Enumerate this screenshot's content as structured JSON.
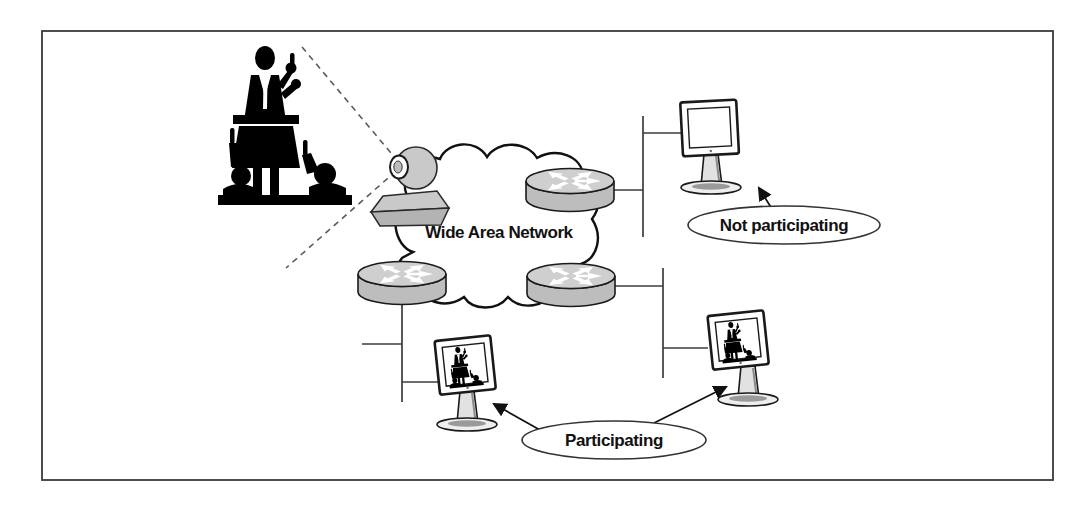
{
  "figure": {
    "type": "network-diagram",
    "wan_label": "Wide Area Network",
    "callouts": {
      "not_participating": "Not participating",
      "participating": "Participating"
    },
    "nodes": {
      "presenter": "speaker-at-podium-with-audience-silhouette",
      "camera": "video-camera-icon",
      "cloud": "wan-cloud",
      "routers": [
        "router-top-right",
        "router-bottom-left",
        "router-bottom-right"
      ],
      "workstations": [
        {
          "id": "workstation-top-right",
          "status": "Not participating",
          "screen": "blank"
        },
        {
          "id": "workstation-bottom-left",
          "status": "Participating",
          "screen": "presenter-video"
        },
        {
          "id": "workstation-bottom-right",
          "status": "Participating",
          "screen": "presenter-video"
        }
      ]
    },
    "colors": {
      "device_gray": "#c9c9c9",
      "device_gray_dark": "#b3b3b3",
      "outline": "#1a1a1a",
      "line": "#3c3c3c",
      "background": "#ffffff"
    }
  }
}
